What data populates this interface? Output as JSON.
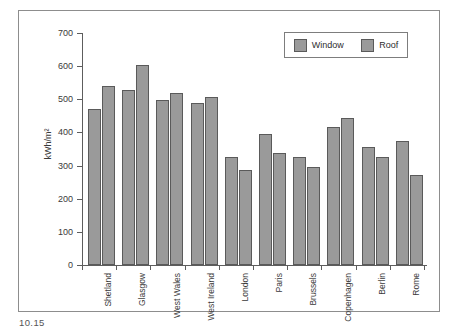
{
  "figure": {
    "caption": "10.15",
    "frame_color": "#8d8d8d"
  },
  "chart_data": {
    "type": "bar",
    "title": "",
    "xlabel": "",
    "ylabel": "kWh/m²",
    "ylim": [
      0,
      700
    ],
    "yticks": [
      0,
      100,
      200,
      300,
      400,
      500,
      600,
      700
    ],
    "ytick_labels": [
      "0",
      "100",
      "200",
      "300",
      "400",
      "500",
      "600",
      "700"
    ],
    "grid": false,
    "legend_position": "top-right",
    "bar_color": "#9a9a9a",
    "bar_edge_color": "#5a5a5a",
    "categories": [
      "Shetland",
      "Glasgow",
      "West Wales",
      "West Ireland",
      "London",
      "Paris",
      "Brussels",
      "Copenhagen",
      "Berlin",
      "Rome"
    ],
    "series": [
      {
        "name": "Window",
        "values": [
          470,
          528,
          498,
          488,
          327,
          396,
          325,
          416,
          355,
          374
        ]
      },
      {
        "name": "Roof",
        "values": [
          540,
          605,
          518,
          507,
          288,
          337,
          295,
          445,
          325,
          273
        ]
      }
    ]
  }
}
